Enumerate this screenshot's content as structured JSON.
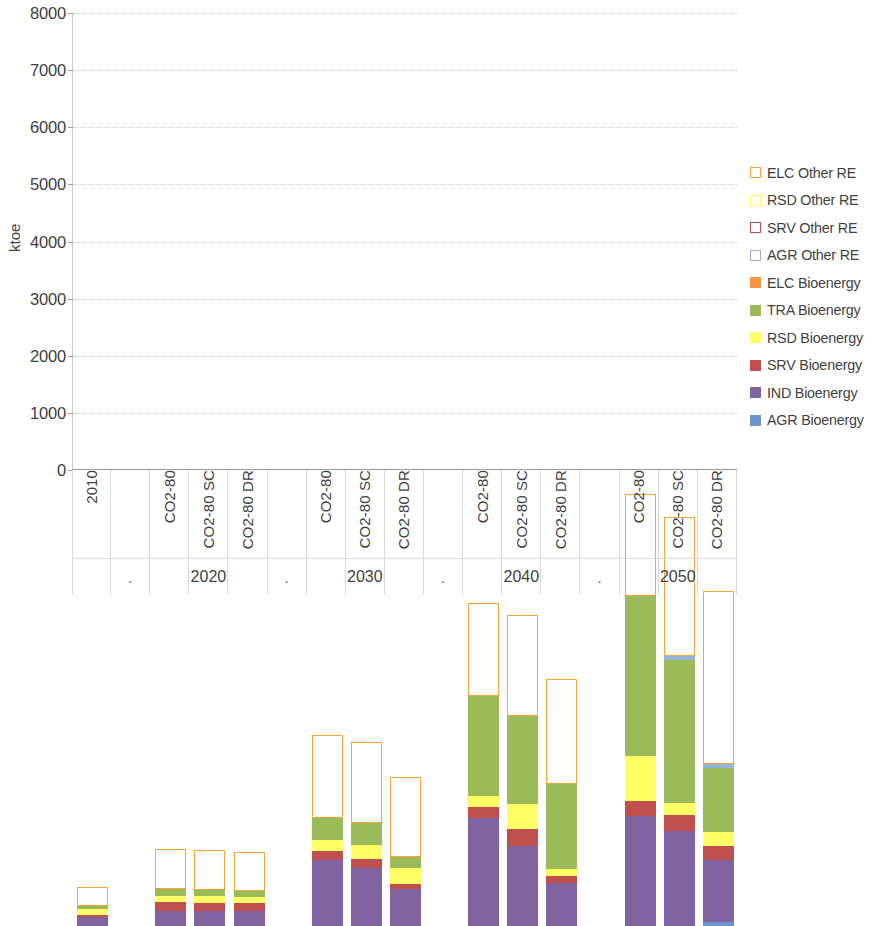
{
  "chart_data": {
    "type": "bar",
    "title": "",
    "subtitle": "",
    "xlabel": "",
    "ylabel": "ktoe",
    "ylim": [
      0,
      8000
    ],
    "ytick_step": 1000,
    "yticks": [
      "0",
      "1000",
      "2000",
      "3000",
      "4000",
      "5000",
      "6000",
      "7000",
      "8000"
    ],
    "grid": true,
    "stacked": true,
    "legend_position": "right",
    "group_labels": [
      "",
      "2020",
      "2030",
      "2040",
      "2050"
    ],
    "categories": [
      "2010",
      "CO2-80",
      "CO2-80 SC",
      "CO2-80 DR",
      "CO2-80",
      "CO2-80 SC",
      "CO2-80 DR",
      "CO2-80",
      "CO2-80 SC",
      "CO2-80 DR",
      "CO2-80",
      "CO2-80 SC",
      "CO2-80 DR"
    ],
    "separator_label": ".",
    "series": [
      {
        "name": "AGR Bioenergy",
        "color": "#6f93cf",
        "style": "filled",
        "values": [
          0,
          0,
          0,
          0,
          0,
          0,
          0,
          0,
          0,
          0,
          0,
          0,
          70
        ]
      },
      {
        "name": "IND Bioenergy",
        "color": "#8064a2",
        "style": "filled",
        "values": [
          160,
          270,
          260,
          260,
          1160,
          1010,
          650,
          1890,
          1400,
          760,
          1930,
          1660,
          1090
        ]
      },
      {
        "name": "SRV Bioenergy",
        "color": "#c0504d",
        "style": "filled",
        "values": [
          40,
          150,
          150,
          140,
          150,
          160,
          80,
          190,
          300,
          120,
          260,
          290,
          240
        ]
      },
      {
        "name": "RSD Bioenergy",
        "color": "#ffff66",
        "style": "filled",
        "values": [
          100,
          110,
          110,
          110,
          200,
          240,
          290,
          190,
          440,
          110,
          790,
          200,
          240
        ]
      },
      {
        "name": "TRA Bioenergy",
        "color": "#9bbb59",
        "style": "filled",
        "values": [
          50,
          110,
          110,
          110,
          380,
          400,
          190,
          1760,
          1530,
          1490,
          2800,
          2510,
          1130
        ]
      },
      {
        "name": "ELC Bioenergy",
        "color": "#f79646",
        "style": "filled",
        "values": [
          0,
          0,
          0,
          0,
          0,
          0,
          0,
          0,
          0,
          0,
          0,
          0,
          0
        ]
      },
      {
        "name": "AGR Other RE",
        "color": "#95b3d7",
        "style": "filled-thin",
        "values": [
          0,
          0,
          0,
          0,
          0,
          0,
          0,
          0,
          0,
          0,
          0,
          70,
          60
        ]
      },
      {
        "name": "SRV Other RE",
        "color": "#c0504d",
        "style": "outline",
        "values": [
          0,
          0,
          0,
          0,
          0,
          0,
          0,
          0,
          0,
          0,
          0,
          0,
          0
        ]
      },
      {
        "name": "RSD Other RE",
        "color": "#ffff66",
        "style": "outline",
        "values": [
          0,
          0,
          0,
          0,
          0,
          0,
          0,
          0,
          0,
          0,
          0,
          0,
          0
        ]
      },
      {
        "name": "ELC Other RE",
        "color": "#f6a33a",
        "style": "outline",
        "values": [
          340,
          700,
          700,
          670,
          1450,
          1410,
          1400,
          1630,
          1770,
          1840,
          1780,
          2430,
          3040
        ]
      }
    ],
    "totals": [
      690,
      1340,
      1330,
      1290,
      3340,
      3220,
      2610,
      5660,
      5440,
      4320,
      7560,
      7160,
      5870
    ]
  },
  "legend": {
    "items": [
      {
        "label": "ELC Other RE",
        "color": "#f6a33a",
        "style": "outline"
      },
      {
        "label": "RSD Other RE",
        "color": "#ffff66",
        "style": "outline"
      },
      {
        "label": "SRV Other RE",
        "color": "#c0504d",
        "style": "outline"
      },
      {
        "label": "AGR Other RE",
        "color": "#95b3d7",
        "style": "outline"
      },
      {
        "label": "ELC Bioenergy",
        "color": "#f79646",
        "style": "filled"
      },
      {
        "label": "TRA Bioenergy",
        "color": "#9bbb59",
        "style": "filled"
      },
      {
        "label": "RSD Bioenergy",
        "color": "#ffff66",
        "style": "filled"
      },
      {
        "label": "SRV Bioenergy",
        "color": "#c0504d",
        "style": "filled"
      },
      {
        "label": "IND Bioenergy",
        "color": "#8064a2",
        "style": "filled"
      },
      {
        "label": "AGR Bioenergy",
        "color": "#6f93cf",
        "style": "filled"
      }
    ]
  }
}
